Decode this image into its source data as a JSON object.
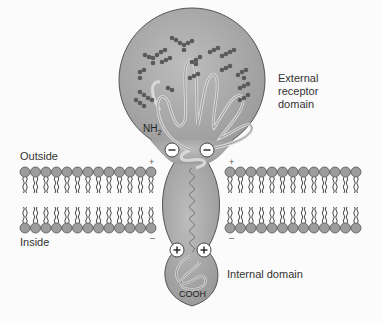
{
  "diagram": {
    "labels": {
      "external_domain": [
        "External",
        "receptor",
        "domain"
      ],
      "outside": "Outside",
      "inside": "Inside",
      "internal_domain": "Internal domain",
      "nh2": "NH",
      "nh2_sub": "2",
      "cooh": "COOH"
    },
    "charges": {
      "plus": "+",
      "minus": "–"
    },
    "colors": {
      "protein_fill": "#a9a9a9",
      "protein_stroke": "#555555",
      "lipid_head": "#9a9a9a",
      "sugar_bead": "#5a5a5a",
      "background": "#fbfbfb"
    }
  }
}
